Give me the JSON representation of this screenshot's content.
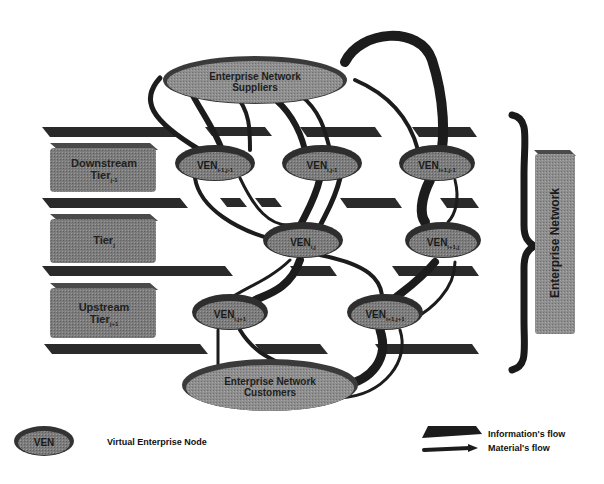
{
  "diagram": {
    "colors": {
      "node_fill": "#7a7a7a",
      "node_dark": "#3c3c3c",
      "flow_dark": "#1c1c1c",
      "tier_box": "#8a8a8a",
      "background": "#ffffff"
    },
    "hubs": {
      "suppliers": {
        "line1": "Enterprise Network",
        "line2": "Suppliers"
      },
      "customers": {
        "line1": "Enterprise Network",
        "line2": "Customers"
      }
    },
    "tiers": [
      {
        "name": "Downstream",
        "label": "Tier",
        "sub": "j-1"
      },
      {
        "name": "",
        "label": "Tier",
        "sub": "j"
      },
      {
        "name": "Upstream",
        "label": "Tier",
        "sub": "j+1"
      }
    ],
    "nodes": [
      {
        "label": "VEN",
        "sub": "i-1,j-1"
      },
      {
        "label": "VEN",
        "sub": "i,j-1"
      },
      {
        "label": "VEN",
        "sub": "i+1,j-1"
      },
      {
        "label": "VEN",
        "sub": "i,j"
      },
      {
        "label": "VEN",
        "sub": "i+1,j"
      },
      {
        "label": "VEN",
        "sub": "i,j+1"
      },
      {
        "label": "VEN",
        "sub": "i+1,j+1"
      }
    ],
    "side_label": "Enterprise Network",
    "legend": {
      "node_icon_label": "VEN",
      "node_desc": "Virtual Enterprise Node",
      "info_flow": "Information's flow",
      "material_flow": "Material's flow"
    }
  }
}
